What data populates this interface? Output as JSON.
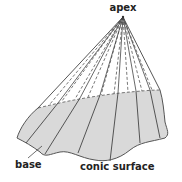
{
  "diagram": {
    "type": "conic-surface",
    "labels": {
      "apex": "apex",
      "base": "base",
      "surface": "conic surface"
    },
    "colors": {
      "base_fill": "#d9d9d9",
      "stroke": "#555555",
      "text": "#222222",
      "background": "#ffffff"
    },
    "apex_point": [
      123,
      17
    ]
  }
}
